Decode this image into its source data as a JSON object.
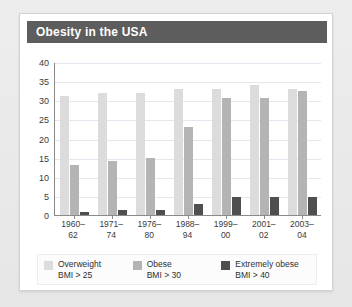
{
  "card": {
    "title": "Obesity in the USA",
    "subtitle": ""
  },
  "chart_data": {
    "type": "bar",
    "title": "Obesity in the USA",
    "xlabel": "",
    "ylabel": "",
    "ylim": [
      0,
      40
    ],
    "yticks": [
      0,
      5,
      10,
      15,
      20,
      25,
      30,
      35,
      40
    ],
    "grid": true,
    "legend_position": "bottom",
    "categories": [
      "1960–62",
      "1971–74",
      "1976–80",
      "1988–94",
      "1999–00",
      "2001–02",
      "2003–04"
    ],
    "series": [
      {
        "name": "Overweight",
        "sublabel": "BMI > 25",
        "color": "#dcdcdc",
        "values": [
          31,
          32,
          32,
          33,
          33,
          34,
          33
        ]
      },
      {
        "name": "Obese",
        "sublabel": "BMI > 30",
        "color": "#b4b4b4",
        "values": [
          13,
          14,
          15,
          23,
          30.5,
          30.5,
          32.5
        ]
      },
      {
        "name": "Extremely obese",
        "sublabel": "BMI > 40",
        "color": "#4f4f4f",
        "values": [
          0.8,
          1.3,
          1.4,
          3,
          4.7,
          4.8,
          4.8
        ]
      }
    ]
  },
  "colors": {
    "titlebar": "#5d5d5d",
    "card": "#ffffff",
    "page": "#e8e8e8",
    "axis": "#8a8a8a",
    "grid": "#e4e8ee"
  }
}
